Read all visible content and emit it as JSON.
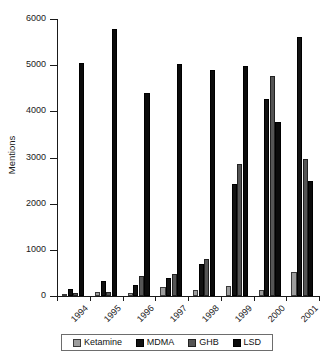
{
  "chart_data": {
    "type": "bar",
    "title": "",
    "xlabel": "",
    "ylabel": "Mentions",
    "ylim": [
      0,
      6000
    ],
    "ytick_values": [
      0,
      1000,
      2000,
      3000,
      4000,
      5000,
      6000
    ],
    "ytick_labels": [
      "0",
      "1000",
      "2000",
      "3000",
      "4000",
      "5000",
      "6000"
    ],
    "grid": false,
    "legend_position": "bottom",
    "categories": [
      "1994",
      "1995",
      "1996",
      "1997",
      "1998",
      "1999",
      "2000",
      "2001"
    ],
    "series": [
      {
        "name": "Ketamine",
        "color": "#9d9d9d",
        "values": [
          40,
          80,
          60,
          200,
          130,
          220,
          120,
          520
        ]
      },
      {
        "name": "MDMA",
        "color": "#121212",
        "values": [
          150,
          320,
          230,
          400,
          700,
          2420,
          4270,
          5600
        ]
      },
      {
        "name": "GHB",
        "color": "#555555",
        "values": [
          70,
          90,
          430,
          480,
          800,
          2850,
          4770,
          2970
        ]
      },
      {
        "name": "LSD",
        "color": "#0b0b0b",
        "values": [
          5050,
          5790,
          4400,
          5030,
          4890,
          4980,
          3780,
          2500
        ]
      }
    ]
  },
  "axis": {
    "y_title": "Mentions"
  },
  "legend": {
    "items": [
      {
        "label": "Ketamine",
        "swatch_class": "sw-ketamine"
      },
      {
        "label": "MDMA",
        "swatch_class": "sw-mdma"
      },
      {
        "label": "GHB",
        "swatch_class": "sw-ghb"
      },
      {
        "label": "LSD",
        "swatch_class": "sw-lsd"
      }
    ]
  }
}
